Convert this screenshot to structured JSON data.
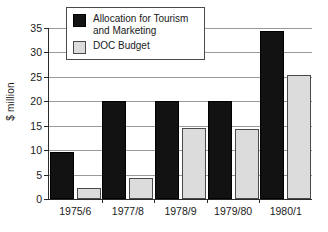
{
  "chart_data": {
    "type": "bar",
    "title": "",
    "xlabel": "",
    "ylabel": "$ million",
    "ylim": [
      0,
      35
    ],
    "ytick_step": 5,
    "yticks": [
      0,
      5,
      10,
      15,
      20,
      25,
      30,
      35
    ],
    "ytick_labels": [
      "0",
      "5",
      "10",
      "15",
      "20",
      "25",
      "30",
      "35"
    ],
    "grid": true,
    "legend_position": "top-left-inside",
    "categories": [
      "1975/6",
      "1977/8",
      "1978/9",
      "1979/80",
      "1980/1"
    ],
    "series": [
      {
        "name": "Allocation for Tourism and Marketing",
        "color": "#121212",
        "values": [
          9.6,
          20.0,
          20.1,
          20.1,
          34.3
        ]
      },
      {
        "name": "DOC Budget",
        "color": "#dcdcdc",
        "values": [
          2.2,
          4.2,
          14.5,
          14.4,
          25.4
        ]
      }
    ],
    "legend": [
      {
        "label": "Allocation for Tourism and Marketing",
        "swatch": "series-dark"
      },
      {
        "label": "DOC Budget",
        "swatch": "series-light"
      }
    ]
  }
}
